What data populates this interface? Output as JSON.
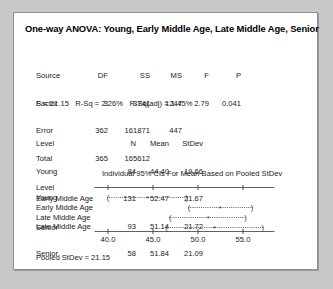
{
  "window": {
    "background_color": "#c8c8c6",
    "panel_color": "#ffffff",
    "border_color": "#8e8e8e"
  },
  "title": "One-way ANOVA: Young, Early Middle Age, Late Middle Age, Senior",
  "anova_table": {
    "headers": [
      "Source",
      "DF",
      "SS",
      "MS",
      "F",
      "P"
    ],
    "rows": [
      {
        "source": "Factor",
        "df": "3",
        "ss": "3741",
        "ms": "1247",
        "f": "2.79",
        "p": "0.041"
      },
      {
        "source": "Error",
        "df": "362",
        "ss": "161871",
        "ms": "447",
        "f": "",
        "p": ""
      },
      {
        "source": "Total",
        "df": "365",
        "ss": "165612",
        "ms": "",
        "f": "",
        "p": ""
      }
    ]
  },
  "model_summary": {
    "text": "S = 21.15   R-Sq = 2.26%   R-Sq(adj) = 1.45%",
    "s": "21.15",
    "r_sq": "2.26%",
    "r_sq_adj": "1.45%"
  },
  "level_table": {
    "headers": [
      "Level",
      "N",
      "Mean",
      "StDev"
    ],
    "rows": [
      {
        "level": "Young",
        "n": "84",
        "mean": "44.40",
        "stdev": "19.66"
      },
      {
        "level": "Early Middle Age",
        "n": "131",
        "mean": "52.47",
        "stdev": "21.67"
      },
      {
        "level": "Late Middle Age",
        "n": "93",
        "mean": "51.14",
        "stdev": "21.72"
      },
      {
        "level": "Senior",
        "n": "58",
        "mean": "51.84",
        "stdev": "21.09"
      }
    ]
  },
  "ci_plot": {
    "caption": "Individual 95% CIs For Mean Based on Pooled StDev",
    "level_header": "Level",
    "labels": [
      "Young",
      "Early Middle Age",
      "Late Middle Age",
      "Senior"
    ],
    "tick_labels": [
      "40.0",
      "45.0",
      "50.0",
      "55.0"
    ],
    "tick_values": [
      40.0,
      45.0,
      50.0,
      55.0
    ]
  },
  "footer": {
    "text": "Pooled StDev = 21.15",
    "pooled_stdev": "21.15"
  },
  "chart_data": {
    "type": "errorbar",
    "title": "Individual 95% CIs For Mean Based on Pooled StDev",
    "xlabel": "",
    "ylabel": "Level",
    "xlim": [
      38.5,
      58.5
    ],
    "grid": false,
    "legend": "none",
    "categories": [
      "Young",
      "Early Middle Age",
      "Late Middle Age",
      "Senior"
    ],
    "means": [
      44.4,
      52.47,
      51.14,
      51.84
    ],
    "ci_lower": [
      39.9,
      48.9,
      46.8,
      46.4
    ],
    "ci_upper": [
      48.9,
      56.1,
      55.4,
      57.3
    ],
    "n": [
      84,
      131,
      93,
      58
    ],
    "stdev": [
      19.66,
      21.67,
      21.72,
      21.09
    ],
    "pooled_stdev": 21.15,
    "confidence_level": "95%",
    "tick_labels": [
      "40.0",
      "45.0",
      "50.0",
      "55.0"
    ],
    "tick_values": [
      40.0,
      45.0,
      50.0,
      55.0
    ]
  }
}
